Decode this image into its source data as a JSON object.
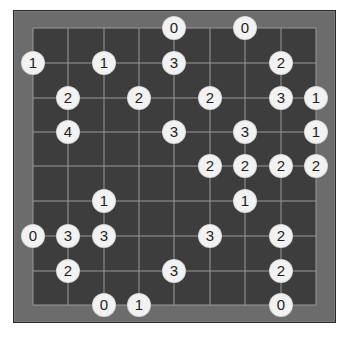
{
  "puzzle": {
    "type": "bridges",
    "grid": {
      "cols": 9,
      "rows": 9
    },
    "col_x": [
      33,
      68,
      104,
      139,
      174,
      210,
      245,
      281,
      316
    ],
    "row_y": [
      28,
      63,
      98,
      132,
      166,
      201,
      236,
      271,
      305
    ],
    "colors": {
      "frame": "#6c6c6c",
      "frame_border": "#2a2a2a",
      "board": "#3d3d3d",
      "grid_line": "#9a9a9a",
      "node_fill": "#f2f2f2",
      "node_text": "#1e1e1e"
    },
    "nodes": [
      {
        "col": 4,
        "row": 0,
        "value": "0"
      },
      {
        "col": 6,
        "row": 0,
        "value": "0"
      },
      {
        "col": 0,
        "row": 1,
        "value": "1"
      },
      {
        "col": 2,
        "row": 1,
        "value": "1"
      },
      {
        "col": 4,
        "row": 1,
        "value": "3"
      },
      {
        "col": 7,
        "row": 1,
        "value": "2"
      },
      {
        "col": 1,
        "row": 2,
        "value": "2"
      },
      {
        "col": 3,
        "row": 2,
        "value": "2"
      },
      {
        "col": 5,
        "row": 2,
        "value": "2"
      },
      {
        "col": 7,
        "row": 2,
        "value": "3"
      },
      {
        "col": 8,
        "row": 2,
        "value": "1"
      },
      {
        "col": 1,
        "row": 3,
        "value": "4"
      },
      {
        "col": 4,
        "row": 3,
        "value": "3"
      },
      {
        "col": 6,
        "row": 3,
        "value": "3"
      },
      {
        "col": 8,
        "row": 3,
        "value": "1"
      },
      {
        "col": 5,
        "row": 4,
        "value": "2"
      },
      {
        "col": 6,
        "row": 4,
        "value": "2"
      },
      {
        "col": 7,
        "row": 4,
        "value": "2"
      },
      {
        "col": 8,
        "row": 4,
        "value": "2"
      },
      {
        "col": 2,
        "row": 5,
        "value": "1"
      },
      {
        "col": 6,
        "row": 5,
        "value": "1"
      },
      {
        "col": 0,
        "row": 6,
        "value": "0"
      },
      {
        "col": 1,
        "row": 6,
        "value": "3"
      },
      {
        "col": 2,
        "row": 6,
        "value": "3"
      },
      {
        "col": 5,
        "row": 6,
        "value": "3"
      },
      {
        "col": 7,
        "row": 6,
        "value": "2"
      },
      {
        "col": 1,
        "row": 7,
        "value": "2"
      },
      {
        "col": 4,
        "row": 7,
        "value": "3"
      },
      {
        "col": 7,
        "row": 7,
        "value": "2"
      },
      {
        "col": 2,
        "row": 8,
        "value": "0"
      },
      {
        "col": 3,
        "row": 8,
        "value": "1"
      },
      {
        "col": 7,
        "row": 8,
        "value": "0"
      }
    ]
  }
}
